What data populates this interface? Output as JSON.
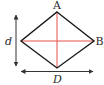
{
  "diagram": {
    "type": "rhombus-diagonals",
    "labels": {
      "top_vertex": "A",
      "right_vertex": "B",
      "short_diagonal": "d",
      "long_diagonal": "D"
    },
    "colors": {
      "outline": "#1a1a1a",
      "diagonals": "#e8504a",
      "arrows": "#333333",
      "text": "#2b2b2b"
    }
  }
}
